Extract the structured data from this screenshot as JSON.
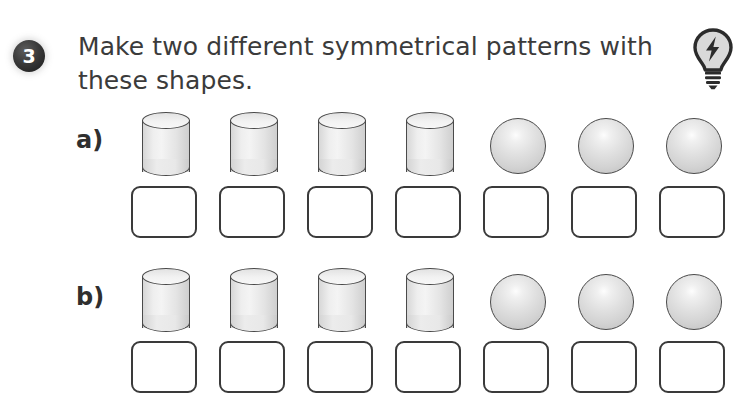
{
  "page": {
    "background_color": "#ffffff"
  },
  "question": {
    "number": "3",
    "badge_color": "#262626",
    "text_color": "#3b3b3b",
    "line1": "Make two different symmetrical patterns with",
    "line2": "these shapes.",
    "hint_icon": "lightbulb-icon"
  },
  "rows": [
    {
      "label": "a)",
      "shapes": [
        "cylinder",
        "cylinder",
        "cylinder",
        "cylinder",
        "sphere",
        "sphere",
        "sphere"
      ],
      "answer_boxes": [
        "",
        "",
        "",
        "",
        "",
        "",
        ""
      ]
    },
    {
      "label": "b)",
      "shapes": [
        "cylinder",
        "cylinder",
        "cylinder",
        "cylinder",
        "sphere",
        "sphere",
        "sphere"
      ],
      "answer_boxes": [
        "",
        "",
        "",
        "",
        "",
        "",
        ""
      ]
    }
  ],
  "layout": {
    "column_start_x": 131,
    "column_pitch": 88,
    "row_a_shape_y": 112,
    "row_a_box_y": 186,
    "row_b_shape_y": 268,
    "row_b_box_y": 341,
    "box_width": 66,
    "box_height": 52,
    "shape_slot_width": 70
  },
  "colors": {
    "outline": "#3a3a3a",
    "shape_fill_light": "#f2f2f2",
    "shape_fill_dark": "#c4c4c4"
  }
}
